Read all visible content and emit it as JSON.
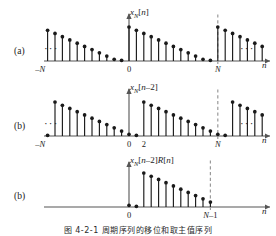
{
  "figure": {
    "caption": "图 4-2-1  周期序列的移位和取主值序列",
    "axis_name": "n",
    "colors": {
      "ink": "#1a1a1a",
      "axis": "#555555",
      "dash": "#9a9a9a"
    }
  },
  "panels": [
    {
      "id": "a",
      "label": "(a)",
      "signal_label": "x_N[n]",
      "signal_html": "<i>x</i><sub>N</sub>[<i>n</i>]",
      "ellipsis_left": "···",
      "ellipsis_right": "···",
      "xaxis_label": "n",
      "tick_labels": [
        "-N",
        "0",
        "N"
      ],
      "dashed_at": "N",
      "shift": 0,
      "windowed": false
    },
    {
      "id": "b",
      "label": "(b)",
      "signal_label": "x_N[n-2]",
      "signal_html": "<i>x</i><sub>N</sub>[<i>n</i>–2]",
      "ellipsis_left": "···",
      "ellipsis_right": "···",
      "xaxis_label": "n",
      "tick_labels": [
        "-N",
        "0",
        "2",
        "N"
      ],
      "dashed_at": "N",
      "shift": 2,
      "windowed": false
    },
    {
      "id": "c",
      "label": "(b)",
      "signal_label": "x_N[n-2]R[n]",
      "signal_html": "<i>x</i><sub>N</sub>[<i>n</i>–2]<i>R</i>[<i>n</i>]",
      "ellipsis_left": "",
      "ellipsis_right": "",
      "xaxis_label": "n",
      "tick_labels": [
        "0",
        "N-1"
      ],
      "dashed_at": "N-1",
      "shift": 2,
      "windowed": true
    }
  ],
  "chart_data": {
    "type": "stem",
    "xlabel": "n",
    "ylabel": "",
    "period_N": 12,
    "period_values": [
      1.0,
      0.905,
      0.81,
      0.715,
      0.62,
      0.525,
      0.43,
      0.335,
      0.24,
      0.145,
      0.05,
      0.02
    ],
    "series": [
      {
        "name": "x_N[n]",
        "panel": "a",
        "shift": 0,
        "x_range": [
          -18,
          18
        ],
        "ticks": [
          {
            "x": -12,
            "label": "-N"
          },
          {
            "x": 0,
            "label": "0"
          },
          {
            "x": 12,
            "label": "N"
          }
        ],
        "dashed_lines": [
          12
        ]
      },
      {
        "name": "x_N[n-2]",
        "panel": "b",
        "shift": 2,
        "x_range": [
          -18,
          18
        ],
        "ticks": [
          {
            "x": -12,
            "label": "-N"
          },
          {
            "x": 0,
            "label": "0"
          },
          {
            "x": 2,
            "label": "2"
          },
          {
            "x": 12,
            "label": "N"
          }
        ],
        "dashed_lines": [
          12
        ]
      },
      {
        "name": "x_N[n-2]R[n]",
        "panel": "c",
        "shift": 2,
        "x_range": [
          -3,
          18
        ],
        "window": [
          0,
          11
        ],
        "ticks": [
          {
            "x": 0,
            "label": "0"
          },
          {
            "x": 11,
            "label": "N-1"
          }
        ],
        "dashed_lines": [
          11
        ]
      }
    ]
  }
}
